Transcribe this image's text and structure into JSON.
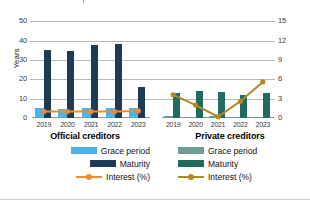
{
  "chart_data": {
    "type": "bar",
    "title": "",
    "panels": [
      {
        "id": "official",
        "title": "Official creditors",
        "categories": [
          "2019",
          "2020",
          "2021",
          "2022",
          "2023"
        ],
        "series": [
          {
            "name": "Grace period",
            "type": "bar",
            "axis": "left",
            "color": "#4EB3E4",
            "values": [
              5.0,
              4.8,
              5.4,
              5.0,
              5.4
            ]
          },
          {
            "name": "Maturity",
            "type": "bar",
            "axis": "left",
            "color": "#1F3A57",
            "values": [
              35.0,
              34.5,
              38.0,
              38.5,
              16.0
            ]
          },
          {
            "name": "Interest (%)",
            "type": "line",
            "axis": "right",
            "color": "#F08C2E",
            "values": [
              1.0,
              1.0,
              1.0,
              1.0,
              1.1
            ]
          }
        ]
      },
      {
        "id": "private",
        "title": "Private creditors",
        "categories": [
          "2019",
          "2020",
          "2021",
          "2022",
          "2023"
        ],
        "series": [
          {
            "name": "Grace period",
            "type": "bar",
            "axis": "left",
            "color": "#6E9B96",
            "values": [
              0.8,
              0.5,
              0.8,
              0.5,
              0.5
            ]
          },
          {
            "name": "Maturity",
            "type": "bar",
            "axis": "left",
            "color": "#216B63",
            "values": [
              13.0,
              14.0,
              13.5,
              12.0,
              13.0
            ]
          },
          {
            "name": "Interest (%)",
            "type": "line",
            "axis": "right",
            "color": "#B08A23",
            "values": [
              3.6,
              2.0,
              0.2,
              2.6,
              5.6
            ]
          }
        ]
      }
    ],
    "yaxis_left": {
      "label": "Years",
      "min": 0,
      "max": 60,
      "ticks": [
        0,
        10,
        20,
        30,
        40,
        50
      ]
    },
    "yaxis_right": {
      "label": "Interest (%)",
      "min": 0,
      "max": 18,
      "ticks": [
        0,
        3,
        6,
        9,
        12,
        15
      ]
    },
    "xlabel": "",
    "grid": true,
    "legend_position": "bottom"
  },
  "axes": {
    "left_title": "Years",
    "right_title": "Interest (%)",
    "left_ticks": [
      "50",
      "40",
      "30",
      "20",
      "10",
      "0"
    ],
    "right_ticks": [
      "15",
      "12",
      "9",
      "6",
      "3",
      "0"
    ]
  },
  "panels": {
    "official": {
      "title": "Official creditors",
      "xlabels": [
        "2019",
        "2020",
        "2021",
        "2022",
        "2023"
      ],
      "legend": [
        {
          "label": "Grace period",
          "color": "#4EB3E4",
          "kind": "bar"
        },
        {
          "label": "Maturity",
          "color": "#1F3A57",
          "kind": "bar"
        },
        {
          "label": "Interest (%)",
          "color": "#F08C2E",
          "kind": "line"
        }
      ]
    },
    "private": {
      "title": "Private creditors",
      "xlabels": [
        "2019",
        "2020",
        "2021",
        "2022",
        "2023"
      ],
      "legend": [
        {
          "label": "Grace period",
          "color": "#6E9B96",
          "kind": "bar"
        },
        {
          "label": "Maturity",
          "color": "#216B63",
          "kind": "bar"
        },
        {
          "label": "Interest (%)",
          "color": "#B08A23",
          "kind": "line"
        }
      ]
    }
  }
}
